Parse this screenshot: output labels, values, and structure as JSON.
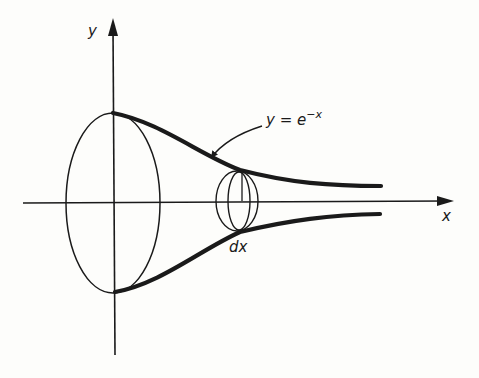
{
  "diagram": {
    "axes": {
      "x_label": "x",
      "y_label": "y"
    },
    "curve_label": {
      "base": "y = e",
      "exponent": "−x"
    },
    "disk_label": "dx",
    "colors": {
      "ink": "#1a1a1a",
      "background": "#fdfdfb"
    }
  }
}
